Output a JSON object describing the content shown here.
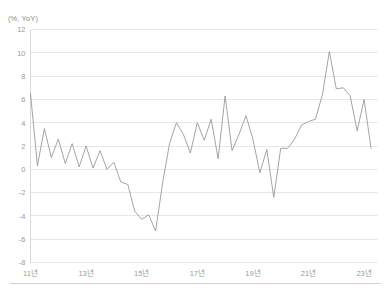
{
  "chart_data": {
    "type": "line",
    "title": "",
    "subtitle": "",
    "xlabel": "",
    "ylabel": "(%, YoY)",
    "unit_label": "(%, YoY)",
    "ylim": [
      -8,
      12
    ],
    "y_ticks": [
      12,
      10,
      8,
      6,
      4,
      2,
      0,
      -2,
      -4,
      -6,
      -8
    ],
    "x_tick_labels": [
      "11년",
      "13년",
      "15년",
      "17년",
      "19년",
      "21년",
      "23년"
    ],
    "x_tick_values": [
      2011,
      2013,
      2015,
      2017,
      2019,
      2021,
      2023
    ],
    "xlim": [
      2011,
      2023.5
    ],
    "grid": "horizontal",
    "legend": "none",
    "series_color": "#9a9a9a",
    "gridline_color": "#d9d9d9",
    "frequency": "quarterly",
    "series": [
      {
        "name": "YoY growth",
        "x": [
          2011.0,
          2011.25,
          2011.5,
          2011.75,
          2012.0,
          2012.25,
          2012.5,
          2012.75,
          2013.0,
          2013.25,
          2013.5,
          2013.75,
          2014.0,
          2014.25,
          2014.5,
          2014.75,
          2015.0,
          2015.25,
          2015.5,
          2015.75,
          2016.0,
          2016.25,
          2016.5,
          2016.75,
          2017.0,
          2017.25,
          2017.5,
          2017.75,
          2018.0,
          2018.25,
          2018.5,
          2018.75,
          2019.0,
          2019.25,
          2019.5,
          2019.75,
          2020.0,
          2020.25,
          2020.5,
          2020.75,
          2021.0,
          2021.25,
          2021.5,
          2021.75,
          2022.0,
          2022.25,
          2022.5,
          2022.75,
          2023.0,
          2023.25
        ],
        "values": [
          6.5,
          0.3,
          3.5,
          1.0,
          2.6,
          0.5,
          2.2,
          0.2,
          2.0,
          0.1,
          1.6,
          0.0,
          0.6,
          -1.1,
          -1.3,
          -3.6,
          -4.3,
          -3.9,
          -5.3,
          -1.2,
          2.2,
          4.0,
          3.0,
          1.4,
          4.0,
          2.5,
          4.3,
          0.9,
          6.3,
          1.6,
          3.0,
          4.6,
          2.6,
          -0.3,
          1.7,
          -2.4,
          1.8,
          1.8,
          2.6,
          3.8,
          4.1,
          4.3,
          6.4,
          10.1,
          6.9,
          7.0,
          6.3,
          3.3,
          6.0,
          1.8
        ]
      }
    ]
  },
  "caption": {
    "text": ""
  }
}
